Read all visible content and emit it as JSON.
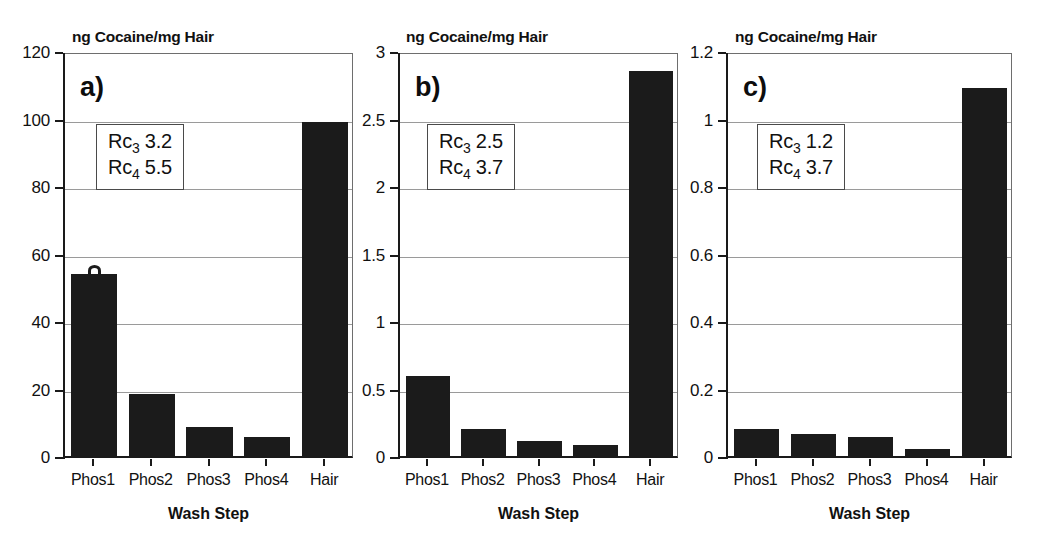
{
  "figure": {
    "background": "#ffffff",
    "bar_color": "#1b1b1b",
    "grid_color": "#9a9a9a",
    "axis_color": "#1a1a1a"
  },
  "chart_data": [
    {
      "type": "bar",
      "panel": "a)",
      "title": "ng Cocaine/mg Hair",
      "xlabel": "Wash Step",
      "ylabel": "ng Cocaine/mg Hair",
      "categories": [
        "Phos1",
        "Phos2",
        "Phos3",
        "Phos4",
        "Hair"
      ],
      "values": [
        54,
        18.5,
        8.5,
        5.5,
        99
      ],
      "ylim": [
        0,
        120
      ],
      "yticks": [
        0,
        20,
        40,
        60,
        80,
        100,
        120
      ],
      "ytick_labels": [
        "0",
        "20",
        "40",
        "60",
        "80",
        "100",
        "120"
      ],
      "grid": true,
      "legend": null,
      "annotations": [
        {
          "label": "Rc",
          "sub": "3",
          "value": "3.2"
        },
        {
          "label": "Rc",
          "sub": "4",
          "value": "5.5"
        }
      ]
    },
    {
      "type": "bar",
      "panel": "b)",
      "title": "ng Cocaine/mg Hair",
      "xlabel": "Wash Step",
      "ylabel": "ng Cocaine/mg Hair",
      "categories": [
        "Phos1",
        "Phos2",
        "Phos3",
        "Phos4",
        "Hair"
      ],
      "values": [
        0.59,
        0.2,
        0.11,
        0.085,
        2.85
      ],
      "ylim": [
        0,
        3
      ],
      "yticks": [
        0,
        0.5,
        1,
        1.5,
        2,
        2.5,
        3
      ],
      "ytick_labels": [
        "0",
        "0.5",
        "1",
        "1.5",
        "2",
        "2.5",
        "3"
      ],
      "grid": true,
      "legend": null,
      "annotations": [
        {
          "label": "Rc",
          "sub": "3",
          "value": "2.5"
        },
        {
          "label": "Rc",
          "sub": "4",
          "value": "3.7"
        }
      ]
    },
    {
      "type": "bar",
      "panel": "c)",
      "title": "ng Cocaine/mg Hair",
      "xlabel": "Wash Step",
      "ylabel": "ng Cocaine/mg Hair",
      "categories": [
        "Phos1",
        "Phos2",
        "Phos3",
        "Phos4",
        "Hair"
      ],
      "values": [
        0.08,
        0.065,
        0.055,
        0.02,
        1.09
      ],
      "ylim": [
        0,
        1.2
      ],
      "yticks": [
        0,
        0.2,
        0.4,
        0.6,
        0.8,
        1,
        1.2
      ],
      "ytick_labels": [
        "0",
        "0.2",
        "0.4",
        "0.6",
        "0.8",
        "1",
        "1.2"
      ],
      "grid": true,
      "legend": null,
      "annotations": [
        {
          "label": "Rc",
          "sub": "3",
          "value": "1.2"
        },
        {
          "label": "Rc",
          "sub": "4",
          "value": "3.7"
        }
      ]
    }
  ],
  "layout": {
    "panels": [
      {
        "plot_left": 64,
        "plot_right": 353,
        "plot_top": 53,
        "plot_bottom": 458,
        "letter_x": 80,
        "letter_y": 72,
        "box_x": 96,
        "box_y": 124,
        "title_x": 72,
        "title_y": 28,
        "bar_artifact": true
      },
      {
        "plot_left": 399,
        "plot_right": 678,
        "plot_top": 53,
        "plot_bottom": 458,
        "letter_x": 415,
        "letter_y": 72,
        "box_x": 427,
        "box_y": 124,
        "title_x": 406,
        "title_y": 28,
        "bar_artifact": false
      },
      {
        "plot_left": 727,
        "plot_right": 1012,
        "plot_top": 53,
        "plot_bottom": 458,
        "letter_x": 743,
        "letter_y": 72,
        "box_x": 757,
        "box_y": 124,
        "title_x": 735,
        "title_y": 28,
        "bar_artifact": false
      }
    ]
  }
}
